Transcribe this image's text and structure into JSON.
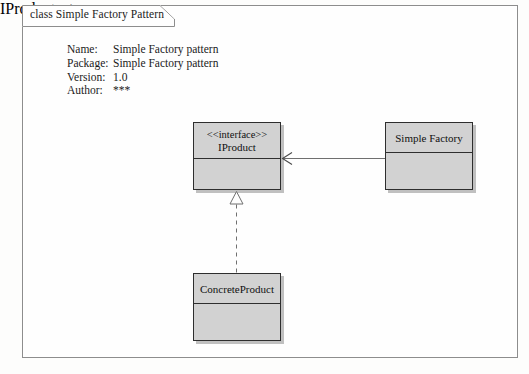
{
  "frame": {
    "tab_label": "class Simple Factory Pattern"
  },
  "metadata": {
    "rows": [
      {
        "key": "Name:",
        "value": "Simple Factory pattern"
      },
      {
        "key": "Package:",
        "value": "Simple Factory pattern"
      },
      {
        "key": "Version:",
        "value": "1.0"
      },
      {
        "key": "Author:",
        "value": "***"
      }
    ]
  },
  "classes": [
    {
      "id": "iproduct",
      "stereotype": "<<interface>>",
      "name": "IProduct"
    },
    {
      "id": "factory",
      "stereotype": "",
      "name": "Simple Factory"
    },
    {
      "id": "concrete",
      "stereotype": "",
      "name": "ConcreteProduct"
    }
  ],
  "connectors": [
    {
      "id": "dependency",
      "type": "dependency",
      "from": "Simple Factory",
      "to": "IProduct",
      "style": "solid",
      "arrowhead": "open-arrow"
    },
    {
      "id": "realization",
      "type": "realization",
      "from": "ConcreteProduct",
      "to": "IProduct",
      "style": "dashed",
      "arrowhead": "hollow-triangle"
    }
  ],
  "colors": {
    "box_fill": "#d2d2d2",
    "box_border": "#2e2e2e",
    "frame_border": "#8d8d8d",
    "line": "#6f6f6f",
    "page_background": "#fdfdfc"
  }
}
